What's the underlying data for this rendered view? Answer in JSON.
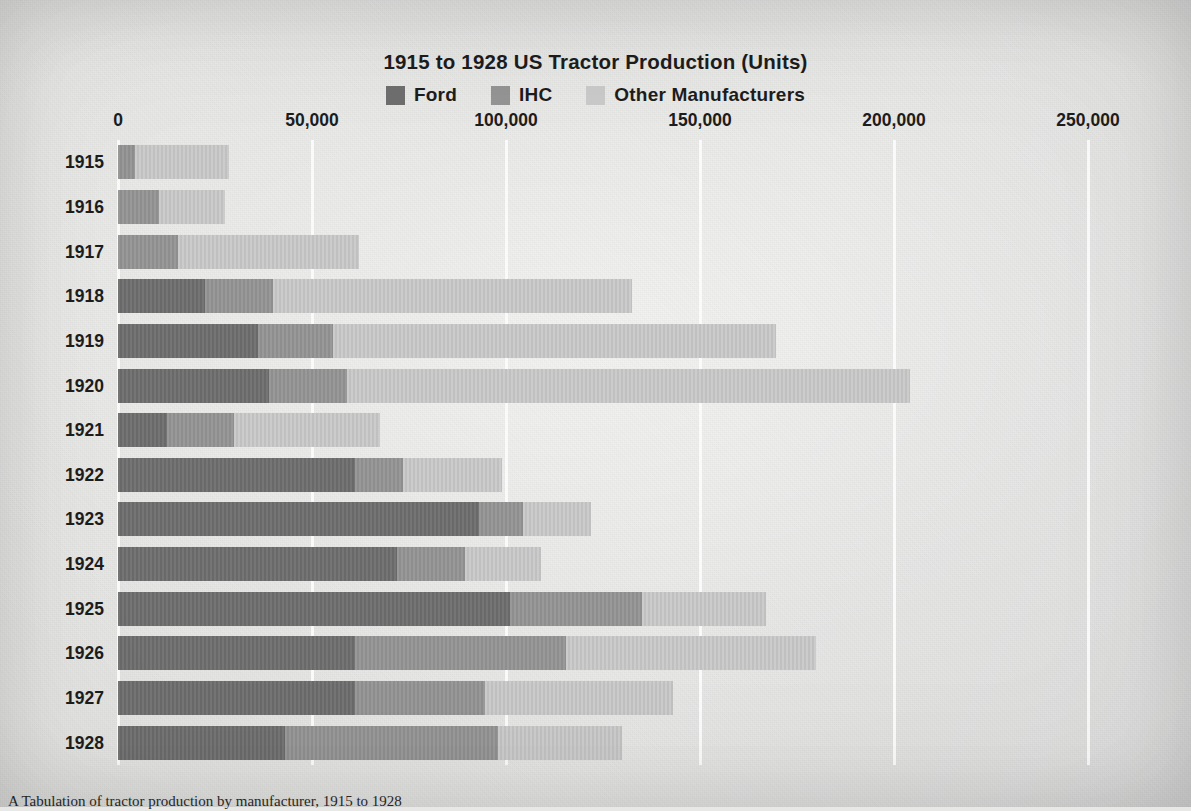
{
  "chart_data": {
    "type": "bar",
    "orientation": "horizontal",
    "stacked": true,
    "title": "1915 to 1928 US Tractor Production (Units)",
    "xlabel": "",
    "ylabel": "",
    "xlim": [
      0,
      250000
    ],
    "xticks": [
      0,
      50000,
      100000,
      150000,
      200000,
      250000
    ],
    "xtick_labels": [
      "0",
      "50,000",
      "100,000",
      "150,000",
      "200,000",
      "250,000"
    ],
    "grid": true,
    "legend_position": "top-center",
    "categories": [
      "1915",
      "1916",
      "1917",
      "1918",
      "1919",
      "1920",
      "1921",
      "1922",
      "1923",
      "1924",
      "1925",
      "1926",
      "1927",
      "1928"
    ],
    "series": [
      {
        "name": "Ford",
        "color": "#6e6e6e",
        "values": [
          0,
          0,
          0,
          22500,
          36000,
          39000,
          12500,
          61000,
          93000,
          72000,
          101000,
          61000,
          61000,
          43000
        ]
      },
      {
        "name": "IHC",
        "color": "#949494",
        "values": [
          4500,
          10500,
          15500,
          17500,
          19500,
          20000,
          17500,
          12500,
          11500,
          17500,
          34000,
          54500,
          33500,
          55000
        ]
      },
      {
        "name": "Other Manufacturers",
        "color": "#c9c9c9",
        "values": [
          24000,
          17000,
          46500,
          92500,
          114000,
          145000,
          37500,
          25500,
          17500,
          19500,
          32000,
          64500,
          48500,
          32000
        ]
      }
    ],
    "totals": [
      28500,
      27500,
      62000,
      132500,
      169500,
      204000,
      67500,
      99000,
      122000,
      109000,
      167000,
      180000,
      143000,
      130000
    ]
  },
  "legend": {
    "items": [
      {
        "label": "Ford",
        "color": "#6e6e6e"
      },
      {
        "label": "IHC",
        "color": "#949494"
      },
      {
        "label": "Other Manufacturers",
        "color": "#c9c9c9"
      }
    ]
  },
  "caption": {
    "text": "A Tabulation of tractor production by manufacturer, 1915 to 1928"
  }
}
